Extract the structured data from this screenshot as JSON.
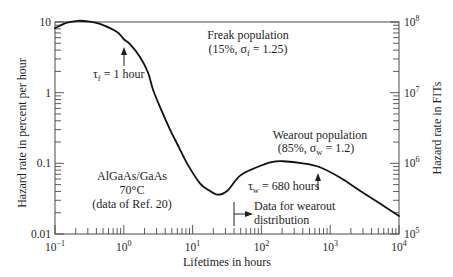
{
  "chart_data": {
    "type": "line",
    "title": "",
    "xlabel": "Lifetimes in hours",
    "ylabel": "Hazard rate in percent per hour",
    "ylabel_right": "Hazard rate in FITs",
    "xscale": "log",
    "yscale": "log",
    "xlim": [
      0.1,
      10000
    ],
    "ylim": [
      0.01,
      10
    ],
    "ylim_right": [
      100000,
      100000000
    ],
    "grid": false,
    "legend": null,
    "x_tick_labels": [
      {
        "value": 0.1,
        "base": "10",
        "exp": "−1"
      },
      {
        "value": 1,
        "base": "10",
        "exp": "0"
      },
      {
        "value": 10,
        "base": "10",
        "exp": "1"
      },
      {
        "value": 100,
        "base": "10",
        "exp": "2"
      },
      {
        "value": 1000,
        "base": "10",
        "exp": "3"
      },
      {
        "value": 10000,
        "base": "10",
        "exp": "4"
      }
    ],
    "y_tick_labels": [
      {
        "value": 10,
        "label": "10"
      },
      {
        "value": 1,
        "label": "1"
      },
      {
        "value": 0.1,
        "label": "0.1"
      },
      {
        "value": 0.01,
        "label": "0.01"
      }
    ],
    "y_right_tick_labels": [
      {
        "value": 100000000,
        "base": "10",
        "exp": "8"
      },
      {
        "value": 10000000,
        "base": "10",
        "exp": "7"
      },
      {
        "value": 1000000,
        "base": "10",
        "exp": "6"
      },
      {
        "value": 100000,
        "base": "10",
        "exp": "5"
      }
    ],
    "series": [
      {
        "name": "Hazard rate (AlGaAs/GaAs, 70°C)",
        "x": [
          0.1,
          0.15,
          0.216,
          0.3,
          0.45,
          0.8,
          1.0,
          1.23,
          1.72,
          2.25,
          2.66,
          3.5,
          4.7,
          6.3,
          8.3,
          12.8,
          17,
          23,
          32,
          49,
          86,
          140,
          206,
          403,
          711,
          1387,
          2710,
          5300,
          10000
        ],
        "y": [
          8.2,
          9.8,
          10.4,
          10.2,
          9.4,
          7.2,
          5.7,
          4.85,
          3.2,
          1.93,
          1.1,
          0.57,
          0.3,
          0.17,
          0.1,
          0.052,
          0.042,
          0.036,
          0.041,
          0.067,
          0.088,
          0.104,
          0.107,
          0.1,
          0.088,
          0.063,
          0.041,
          0.027,
          0.018
        ]
      }
    ],
    "annotations": {
      "freak_title": "Freak population",
      "freak_params": {
        "pre": "(15%, σ",
        "sub": "f",
        "post": " = 1.25)"
      },
      "tau_f": {
        "pre": "τ",
        "sub": "f",
        "post": " = 1 hour",
        "x": 1
      },
      "wearout_title": "Wearout population",
      "wearout_params": {
        "pre": "(85%, σ",
        "sub": "w",
        "post": " = 1.2)"
      },
      "tau_w": {
        "pre": "τ",
        "sub": "w",
        "post": " = 680 hours",
        "x": 680
      },
      "material": {
        "line1": "AlGaAs/GaAs",
        "line2": "70°C",
        "line3": "(data of Ref. 20)"
      },
      "data_note": {
        "line1": "Data for wearout",
        "line2": "distribution",
        "x": 40
      }
    }
  }
}
